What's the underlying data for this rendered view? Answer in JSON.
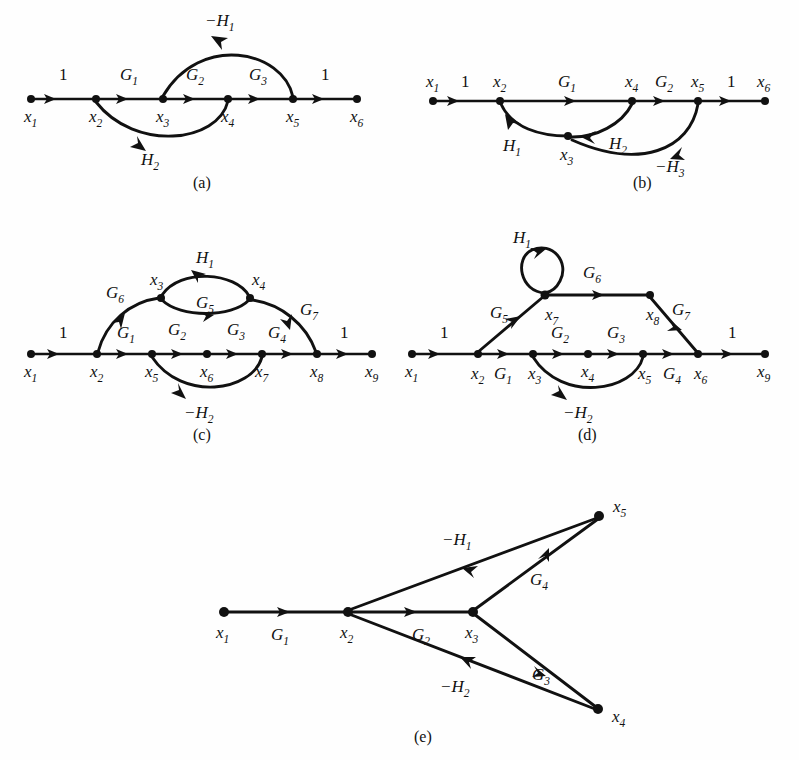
{
  "figure": {
    "kind": "signal-flow-graphs",
    "background_color": "#fefefe",
    "ink_color": "#111111",
    "subfigures": [
      {
        "id": "a",
        "caption": "(a)",
        "nodes": [
          {
            "id": "x1",
            "base": "x",
            "sub": "1"
          },
          {
            "id": "x2",
            "base": "x",
            "sub": "2"
          },
          {
            "id": "x3",
            "base": "x",
            "sub": "3"
          },
          {
            "id": "x4",
            "base": "x",
            "sub": "4"
          },
          {
            "id": "x5",
            "base": "x",
            "sub": "5"
          },
          {
            "id": "x6",
            "base": "x",
            "sub": "6"
          }
        ],
        "edges": [
          {
            "from": "x1",
            "to": "x2",
            "gain": "1",
            "gain_base": "1",
            "gain_sub": "",
            "shape": "straight"
          },
          {
            "from": "x2",
            "to": "x3",
            "gain": "G1",
            "gain_base": "G",
            "gain_sub": "1",
            "shape": "straight"
          },
          {
            "from": "x3",
            "to": "x4",
            "gain": "G2",
            "gain_base": "G",
            "gain_sub": "2",
            "shape": "straight"
          },
          {
            "from": "x4",
            "to": "x5",
            "gain": "G3",
            "gain_base": "G",
            "gain_sub": "3",
            "shape": "straight"
          },
          {
            "from": "x5",
            "to": "x6",
            "gain": "1",
            "gain_base": "1",
            "gain_sub": "",
            "shape": "straight"
          },
          {
            "from": "x5",
            "to": "x3",
            "gain": "-H1",
            "gain_base": "−H",
            "gain_sub": "1",
            "shape": "arc-above"
          },
          {
            "from": "x4",
            "to": "x2",
            "gain": "H2",
            "gain_base": "H",
            "gain_sub": "2",
            "shape": "arc-below"
          }
        ]
      },
      {
        "id": "b",
        "caption": "(b)",
        "nodes": [
          {
            "id": "x1",
            "base": "x",
            "sub": "1"
          },
          {
            "id": "x2",
            "base": "x",
            "sub": "2"
          },
          {
            "id": "x3",
            "base": "x",
            "sub": "3"
          },
          {
            "id": "x4",
            "base": "x",
            "sub": "4"
          },
          {
            "id": "x5",
            "base": "x",
            "sub": "5"
          },
          {
            "id": "x6",
            "base": "x",
            "sub": "6"
          }
        ],
        "edges": [
          {
            "from": "x1",
            "to": "x2",
            "gain": "1",
            "gain_base": "1",
            "gain_sub": "",
            "shape": "straight"
          },
          {
            "from": "x2",
            "to": "x4",
            "gain": "G1",
            "gain_base": "G",
            "gain_sub": "1",
            "shape": "straight"
          },
          {
            "from": "x4",
            "to": "x5",
            "gain": "G2",
            "gain_base": "G",
            "gain_sub": "2",
            "shape": "straight"
          },
          {
            "from": "x5",
            "to": "x6",
            "gain": "1",
            "gain_base": "1",
            "gain_sub": "",
            "shape": "straight"
          },
          {
            "from": "x3",
            "to": "x2",
            "gain": "H1",
            "gain_base": "H",
            "gain_sub": "1",
            "shape": "arc-below"
          },
          {
            "from": "x4",
            "to": "x3",
            "gain": "H2",
            "gain_base": "H",
            "gain_sub": "2",
            "shape": "arc-below"
          },
          {
            "from": "x5",
            "to": "x3",
            "gain": "-H3",
            "gain_base": "−H",
            "gain_sub": "3",
            "shape": "arc-below-deep"
          }
        ]
      },
      {
        "id": "c",
        "caption": "(c)",
        "nodes": [
          {
            "id": "x1",
            "base": "x",
            "sub": "1"
          },
          {
            "id": "x2",
            "base": "x",
            "sub": "2"
          },
          {
            "id": "x3",
            "base": "x",
            "sub": "3"
          },
          {
            "id": "x4",
            "base": "x",
            "sub": "4"
          },
          {
            "id": "x5",
            "base": "x",
            "sub": "5"
          },
          {
            "id": "x6",
            "base": "x",
            "sub": "6"
          },
          {
            "id": "x7",
            "base": "x",
            "sub": "7"
          },
          {
            "id": "x8",
            "base": "x",
            "sub": "8"
          },
          {
            "id": "x9",
            "base": "x",
            "sub": "9"
          }
        ],
        "edges": [
          {
            "from": "x1",
            "to": "x2",
            "gain": "1",
            "gain_base": "1",
            "gain_sub": "",
            "shape": "straight"
          },
          {
            "from": "x2",
            "to": "x5",
            "gain": "G1",
            "gain_base": "G",
            "gain_sub": "1",
            "shape": "straight"
          },
          {
            "from": "x5",
            "to": "x6",
            "gain": "G2",
            "gain_base": "G",
            "gain_sub": "2",
            "shape": "straight"
          },
          {
            "from": "x6",
            "to": "x7",
            "gain": "G3",
            "gain_base": "G",
            "gain_sub": "3",
            "shape": "straight"
          },
          {
            "from": "x7",
            "to": "x8",
            "gain": "G4",
            "gain_base": "G",
            "gain_sub": "4",
            "shape": "straight"
          },
          {
            "from": "x8",
            "to": "x9",
            "gain": "1",
            "gain_base": "1",
            "gain_sub": "",
            "shape": "straight"
          },
          {
            "from": "x2",
            "to": "x3",
            "gain": "G6",
            "gain_base": "G",
            "gain_sub": "6",
            "shape": "arc-up"
          },
          {
            "from": "x3",
            "to": "x4",
            "gain": "G5",
            "gain_base": "G",
            "gain_sub": "5",
            "shape": "arc-below-small"
          },
          {
            "from": "x4",
            "to": "x3",
            "gain": "H1",
            "gain_base": "H",
            "gain_sub": "1",
            "shape": "arc-above-small"
          },
          {
            "from": "x4",
            "to": "x8",
            "gain": "G7",
            "gain_base": "G",
            "gain_sub": "7",
            "shape": "arc-down"
          },
          {
            "from": "x7",
            "to": "x5",
            "gain": "-H2",
            "gain_base": "−H",
            "gain_sub": "2",
            "shape": "arc-below"
          }
        ]
      },
      {
        "id": "d",
        "caption": "(d)",
        "nodes": [
          {
            "id": "x1",
            "base": "x",
            "sub": "1"
          },
          {
            "id": "x2",
            "base": "x",
            "sub": "2"
          },
          {
            "id": "x3",
            "base": "x",
            "sub": "3"
          },
          {
            "id": "x4",
            "base": "x",
            "sub": "4"
          },
          {
            "id": "x5",
            "base": "x",
            "sub": "5"
          },
          {
            "id": "x6",
            "base": "x",
            "sub": "6"
          },
          {
            "id": "x7",
            "base": "x",
            "sub": "7"
          },
          {
            "id": "x8",
            "base": "x",
            "sub": "8"
          },
          {
            "id": "x9",
            "base": "x",
            "sub": "9"
          }
        ],
        "edges": [
          {
            "from": "x1",
            "to": "x2",
            "gain": "1",
            "gain_base": "1",
            "gain_sub": "",
            "shape": "straight"
          },
          {
            "from": "x2",
            "to": "x3",
            "gain": "G1",
            "gain_base": "G",
            "gain_sub": "1",
            "shape": "straight"
          },
          {
            "from": "x3",
            "to": "x4",
            "gain": "G2",
            "gain_base": "G",
            "gain_sub": "2",
            "shape": "straight"
          },
          {
            "from": "x4",
            "to": "x5",
            "gain": "G3",
            "gain_base": "G",
            "gain_sub": "3",
            "shape": "straight"
          },
          {
            "from": "x5",
            "to": "x6",
            "gain": "G4",
            "gain_base": "G",
            "gain_sub": "4",
            "shape": "straight"
          },
          {
            "from": "x6",
            "to": "x9",
            "gain": "1",
            "gain_base": "1",
            "gain_sub": "",
            "shape": "straight"
          },
          {
            "from": "x2",
            "to": "x7",
            "gain": "G5",
            "gain_base": "G",
            "gain_sub": "5",
            "shape": "diag-up"
          },
          {
            "from": "x7",
            "to": "x7",
            "gain": "H1",
            "gain_base": "H",
            "gain_sub": "1",
            "shape": "self-loop"
          },
          {
            "from": "x7",
            "to": "x8",
            "gain": "G6",
            "gain_base": "G",
            "gain_sub": "6",
            "shape": "straight"
          },
          {
            "from": "x8",
            "to": "x6",
            "gain": "G7",
            "gain_base": "G",
            "gain_sub": "7",
            "shape": "diag-down"
          },
          {
            "from": "x5",
            "to": "x3",
            "gain": "-H2",
            "gain_base": "−H",
            "gain_sub": "2",
            "shape": "arc-below"
          }
        ]
      },
      {
        "id": "e",
        "caption": "(e)",
        "nodes": [
          {
            "id": "x1",
            "base": "x",
            "sub": "1"
          },
          {
            "id": "x2",
            "base": "x",
            "sub": "2"
          },
          {
            "id": "x3",
            "base": "x",
            "sub": "3"
          },
          {
            "id": "x4",
            "base": "x",
            "sub": "4"
          },
          {
            "id": "x5",
            "base": "x",
            "sub": "5"
          }
        ],
        "edges": [
          {
            "from": "x1",
            "to": "x2",
            "gain": "G1",
            "gain_base": "G",
            "gain_sub": "1",
            "shape": "straight"
          },
          {
            "from": "x2",
            "to": "x3",
            "gain": "G2",
            "gain_base": "G",
            "gain_sub": "2",
            "shape": "straight"
          },
          {
            "from": "x3",
            "to": "x5",
            "gain": "G4",
            "gain_base": "G",
            "gain_sub": "4",
            "shape": "straight"
          },
          {
            "from": "x3",
            "to": "x4",
            "gain": "G3",
            "gain_base": "G",
            "gain_sub": "3",
            "shape": "straight"
          },
          {
            "from": "x5",
            "to": "x2",
            "gain": "-H1",
            "gain_base": "−H",
            "gain_sub": "1",
            "shape": "straight"
          },
          {
            "from": "x4",
            "to": "x2",
            "gain": "-H2",
            "gain_base": "−H",
            "gain_sub": "2",
            "shape": "straight"
          }
        ]
      }
    ]
  },
  "a": {
    "caption": "(a)",
    "n1": {
      "b": "x",
      "s": "1"
    },
    "n2": {
      "b": "x",
      "s": "2"
    },
    "n3": {
      "b": "x",
      "s": "3"
    },
    "n4": {
      "b": "x",
      "s": "4"
    },
    "n5": {
      "b": "x",
      "s": "5"
    },
    "n6": {
      "b": "x",
      "s": "6"
    },
    "g_one_left": "1",
    "g_one_right": "1",
    "g1": {
      "b": "G",
      "s": "1"
    },
    "g2": {
      "b": "G",
      "s": "2"
    },
    "g3": {
      "b": "G",
      "s": "3"
    },
    "h1": {
      "b": "−H",
      "s": "1"
    },
    "h2": {
      "b": "H",
      "s": "2"
    }
  },
  "b": {
    "caption": "(b)",
    "n1": {
      "b": "x",
      "s": "1"
    },
    "n2": {
      "b": "x",
      "s": "2"
    },
    "n3": {
      "b": "x",
      "s": "3"
    },
    "n4": {
      "b": "x",
      "s": "4"
    },
    "n5": {
      "b": "x",
      "s": "5"
    },
    "n6": {
      "b": "x",
      "s": "6"
    },
    "g_one_left": "1",
    "g_one_right": "1",
    "g1": {
      "b": "G",
      "s": "1"
    },
    "g2": {
      "b": "G",
      "s": "2"
    },
    "h1": {
      "b": "H",
      "s": "1"
    },
    "h2": {
      "b": "H",
      "s": "2"
    },
    "h3": {
      "b": "−H",
      "s": "3"
    }
  },
  "c": {
    "caption": "(c)",
    "n1": {
      "b": "x",
      "s": "1"
    },
    "n2": {
      "b": "x",
      "s": "2"
    },
    "n3": {
      "b": "x",
      "s": "3"
    },
    "n4": {
      "b": "x",
      "s": "4"
    },
    "n5": {
      "b": "x",
      "s": "5"
    },
    "n6": {
      "b": "x",
      "s": "6"
    },
    "n7": {
      "b": "x",
      "s": "7"
    },
    "n8": {
      "b": "x",
      "s": "8"
    },
    "n9": {
      "b": "x",
      "s": "9"
    },
    "g_one_left": "1",
    "g_one_right": "1",
    "g1": {
      "b": "G",
      "s": "1"
    },
    "g2": {
      "b": "G",
      "s": "2"
    },
    "g3": {
      "b": "G",
      "s": "3"
    },
    "g4": {
      "b": "G",
      "s": "4"
    },
    "g5": {
      "b": "G",
      "s": "5"
    },
    "g6": {
      "b": "G",
      "s": "6"
    },
    "g7": {
      "b": "G",
      "s": "7"
    },
    "h1": {
      "b": "H",
      "s": "1"
    },
    "h2": {
      "b": "−H",
      "s": "2"
    }
  },
  "d": {
    "caption": "(d)",
    "n1": {
      "b": "x",
      "s": "1"
    },
    "n2": {
      "b": "x",
      "s": "2"
    },
    "n3": {
      "b": "x",
      "s": "3"
    },
    "n4": {
      "b": "x",
      "s": "4"
    },
    "n5": {
      "b": "x",
      "s": "5"
    },
    "n6": {
      "b": "x",
      "s": "6"
    },
    "n7": {
      "b": "x",
      "s": "7"
    },
    "n8": {
      "b": "x",
      "s": "8"
    },
    "n9": {
      "b": "x",
      "s": "9"
    },
    "g_one_left": "1",
    "g_one_right": "1",
    "g1": {
      "b": "G",
      "s": "1"
    },
    "g2": {
      "b": "G",
      "s": "2"
    },
    "g3": {
      "b": "G",
      "s": "3"
    },
    "g4": {
      "b": "G",
      "s": "4"
    },
    "g5": {
      "b": "G",
      "s": "5"
    },
    "g6": {
      "b": "G",
      "s": "6"
    },
    "g7": {
      "b": "G",
      "s": "7"
    },
    "h1": {
      "b": "H",
      "s": "1"
    },
    "h2": {
      "b": "−H",
      "s": "2"
    }
  },
  "e": {
    "caption": "(e)",
    "n1": {
      "b": "x",
      "s": "1"
    },
    "n2": {
      "b": "x",
      "s": "2"
    },
    "n3": {
      "b": "x",
      "s": "3"
    },
    "n4": {
      "b": "x",
      "s": "4"
    },
    "n5": {
      "b": "x",
      "s": "5"
    },
    "g1": {
      "b": "G",
      "s": "1"
    },
    "g2": {
      "b": "G",
      "s": "2"
    },
    "g3": {
      "b": "G",
      "s": "3"
    },
    "g4": {
      "b": "G",
      "s": "4"
    },
    "h1": {
      "b": "−H",
      "s": "1"
    },
    "h2": {
      "b": "−H",
      "s": "2"
    }
  }
}
